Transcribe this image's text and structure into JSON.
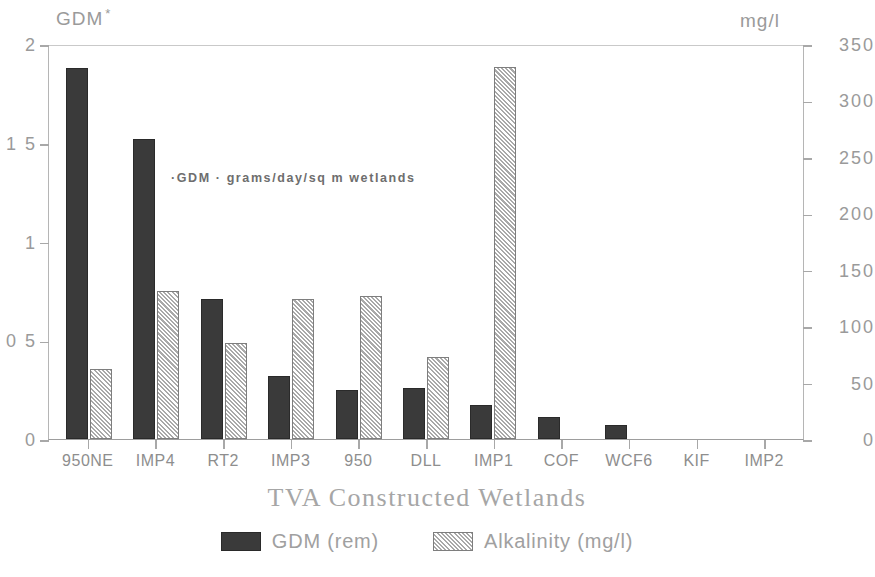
{
  "chart_data": {
    "type": "bar",
    "title": "",
    "xlabel": "TVA Constructed Wetlands",
    "ylabel": "GDM",
    "y2label": "mg/l",
    "grid": false,
    "legend_position": "bottom-center",
    "categories": [
      "950NE",
      "IMP4",
      "RT2",
      "IMP3",
      "950",
      "DLL",
      "IMP1",
      "COF",
      "WCF6",
      "KIF",
      "IMP2"
    ],
    "ylim": [
      0,
      2
    ],
    "y2lim": [
      0,
      350
    ],
    "yticks": [
      "0",
      "0.5",
      "1",
      "1.5",
      "2"
    ],
    "ytick_labels_as_drawn": [
      "0",
      "0 5",
      "1",
      "1 5",
      "2"
    ],
    "y2ticks": [
      "0",
      "50",
      "100",
      "150",
      "200",
      "250",
      "300",
      "350"
    ],
    "annotation": "·GDM · grams/day/sq m wetlands",
    "series": [
      {
        "name": "GDM (rem)",
        "axis": "left",
        "unit": "grams/day/sq m wetlands",
        "color": "#3a3a3a",
        "values": [
          1.88,
          1.52,
          0.71,
          0.32,
          0.25,
          0.26,
          0.17,
          0.11,
          0.07,
          0.0,
          0.0
        ]
      },
      {
        "name": "Alkalinity (mg/l)",
        "axis": "right",
        "unit": "mg/l",
        "color": "#d8d8d8",
        "values": [
          62,
          131,
          85,
          124,
          127,
          73,
          330,
          0,
          0,
          0,
          0
        ]
      }
    ]
  },
  "axis_captions": {
    "left": "GDM",
    "left_marker": "*",
    "right": "mg/l"
  },
  "legend": {
    "items": [
      {
        "label": "GDM (rem)",
        "swatch": "dark-solid"
      },
      {
        "label": "Alkalinity (mg/l)",
        "swatch": "light-hatched"
      }
    ]
  }
}
